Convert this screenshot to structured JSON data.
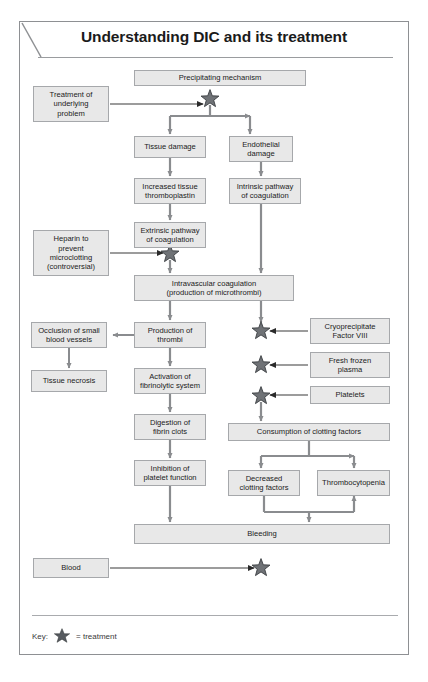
{
  "title": "Understanding DIC and its treatment",
  "key": {
    "label": "Key:",
    "star_meaning": "= treatment",
    "star_icon": "star-icon"
  },
  "colors": {
    "box_fill": "#e8e8e8",
    "box_border": "#a6a8ab",
    "arrow": "#8a8c8f",
    "star": "#6f7276",
    "frame": "#8e9093",
    "text": "#1b1b1b"
  },
  "chart_data": {
    "type": "diagram",
    "title": "Understanding DIC and its treatment",
    "nodes": [
      {
        "id": "precipitating",
        "label": "Precipitating mechanism",
        "x": 134,
        "y": 70,
        "w": 172,
        "h": 16
      },
      {
        "id": "treatment-underlying",
        "label": "Treatment of\nunderlying\nproblem",
        "x": 33,
        "y": 86,
        "w": 76,
        "h": 36
      },
      {
        "id": "tissue-damage",
        "label": "Tissue damage",
        "x": 134,
        "y": 136,
        "w": 72,
        "h": 22
      },
      {
        "id": "endothelial-damage",
        "label": "Endothelial\ndamage",
        "x": 229,
        "y": 136,
        "w": 64,
        "h": 26
      },
      {
        "id": "increased-thromboplastin",
        "label": "Increased tissue\nthromboplastin",
        "x": 134,
        "y": 178,
        "w": 72,
        "h": 26
      },
      {
        "id": "intrinsic-pathway",
        "label": "Intrinsic pathway\nof coagulation",
        "x": 229,
        "y": 178,
        "w": 72,
        "h": 26
      },
      {
        "id": "extrinsic-pathway",
        "label": "Extrinsic pathway\nof coagulation",
        "x": 134,
        "y": 222,
        "w": 72,
        "h": 26
      },
      {
        "id": "heparin",
        "label": "Heparin to\nprevent\nmicroclotting\n(controversial)",
        "x": 33,
        "y": 230,
        "w": 76,
        "h": 46
      },
      {
        "id": "intravascular-coagulation",
        "label": "Intravascular coagulation\n(production of microthrombi)",
        "x": 134,
        "y": 275,
        "w": 160,
        "h": 26
      },
      {
        "id": "production-thrombi",
        "label": "Production of\nthrombi",
        "x": 134,
        "y": 322,
        "w": 72,
        "h": 26
      },
      {
        "id": "occlusion-vessels",
        "label": "Occlusion of small\nblood vessels",
        "x": 31,
        "y": 322,
        "w": 76,
        "h": 26
      },
      {
        "id": "tissue-necrosis",
        "label": "Tissue necrosis",
        "x": 31,
        "y": 370,
        "w": 76,
        "h": 22
      },
      {
        "id": "cryoprecipitate",
        "label": "Cryoprecipitate\nFactor VIII",
        "x": 310,
        "y": 318,
        "w": 80,
        "h": 26
      },
      {
        "id": "fresh-frozen-plasma",
        "label": "Fresh frozen\nplasma",
        "x": 310,
        "y": 352,
        "w": 80,
        "h": 26
      },
      {
        "id": "platelets",
        "label": "Platelets",
        "x": 310,
        "y": 386,
        "w": 80,
        "h": 18
      },
      {
        "id": "activation-fibrinolytic",
        "label": "Activation of\nfibrinolytic system",
        "x": 134,
        "y": 368,
        "w": 72,
        "h": 26
      },
      {
        "id": "consumption-clotting",
        "label": "Consumption of clotting factors",
        "x": 228,
        "y": 423,
        "w": 162,
        "h": 18
      },
      {
        "id": "digestion-fibrin",
        "label": "Digestion of\nfibrin clots",
        "x": 134,
        "y": 414,
        "w": 72,
        "h": 26
      },
      {
        "id": "decreased-clotting",
        "label": "Decreased\nclotting factors",
        "x": 228,
        "y": 470,
        "w": 72,
        "h": 26
      },
      {
        "id": "thrombocytopenia",
        "label": "Thrombocytopenia",
        "x": 317,
        "y": 470,
        "w": 73,
        "h": 26
      },
      {
        "id": "inhibition-platelet",
        "label": "Inhibition of\nplatelet function",
        "x": 134,
        "y": 460,
        "w": 72,
        "h": 26
      },
      {
        "id": "bleeding",
        "label": "Bleeding",
        "x": 134,
        "y": 524,
        "w": 256,
        "h": 20
      },
      {
        "id": "blood",
        "label": "Blood",
        "x": 33,
        "y": 558,
        "w": 76,
        "h": 20
      }
    ],
    "treatment_stars": [
      {
        "id": "star-precipitating",
        "cx": 210,
        "cy": 99,
        "target": "precipitating"
      },
      {
        "id": "star-heparin",
        "cx": 170,
        "cy": 254,
        "target": "extrinsic-pathway"
      },
      {
        "id": "star-cryoprecipitate",
        "cx": 261,
        "cy": 331,
        "target": "cryoprecipitate"
      },
      {
        "id": "star-plasma",
        "cx": 261,
        "cy": 365,
        "target": "fresh-frozen-plasma"
      },
      {
        "id": "star-platelets",
        "cx": 261,
        "cy": 396,
        "target": "platelets"
      },
      {
        "id": "star-blood",
        "cx": 261,
        "cy": 568,
        "target": "blood"
      }
    ],
    "edges": [
      {
        "from": "precipitating",
        "to": "tissue-damage"
      },
      {
        "from": "precipitating",
        "to": "endothelial-damage"
      },
      {
        "from": "treatment-underlying",
        "to": "star-precipitating"
      },
      {
        "from": "tissue-damage",
        "to": "increased-thromboplastin"
      },
      {
        "from": "endothelial-damage",
        "to": "intrinsic-pathway"
      },
      {
        "from": "increased-thromboplastin",
        "to": "extrinsic-pathway"
      },
      {
        "from": "extrinsic-pathway",
        "to": "intravascular-coagulation"
      },
      {
        "from": "intrinsic-pathway",
        "to": "intravascular-coagulation"
      },
      {
        "from": "heparin",
        "to": "star-heparin"
      },
      {
        "from": "intravascular-coagulation",
        "to": "production-thrombi"
      },
      {
        "from": "intravascular-coagulation",
        "to": "consumption-clotting"
      },
      {
        "from": "production-thrombi",
        "to": "occlusion-vessels"
      },
      {
        "from": "occlusion-vessels",
        "to": "tissue-necrosis"
      },
      {
        "from": "production-thrombi",
        "to": "activation-fibrinolytic"
      },
      {
        "from": "activation-fibrinolytic",
        "to": "digestion-fibrin"
      },
      {
        "from": "digestion-fibrin",
        "to": "inhibition-platelet"
      },
      {
        "from": "inhibition-platelet",
        "to": "bleeding"
      },
      {
        "from": "cryoprecipitate",
        "to": "star-cryoprecipitate"
      },
      {
        "from": "fresh-frozen-plasma",
        "to": "star-plasma"
      },
      {
        "from": "platelets",
        "to": "star-platelets"
      },
      {
        "from": "consumption-clotting",
        "to": "decreased-clotting"
      },
      {
        "from": "consumption-clotting",
        "to": "thrombocytopenia"
      },
      {
        "from": "decreased-clotting",
        "to": "bleeding"
      },
      {
        "from": "thrombocytopenia",
        "to": "bleeding"
      },
      {
        "from": "blood",
        "to": "star-blood"
      }
    ]
  }
}
